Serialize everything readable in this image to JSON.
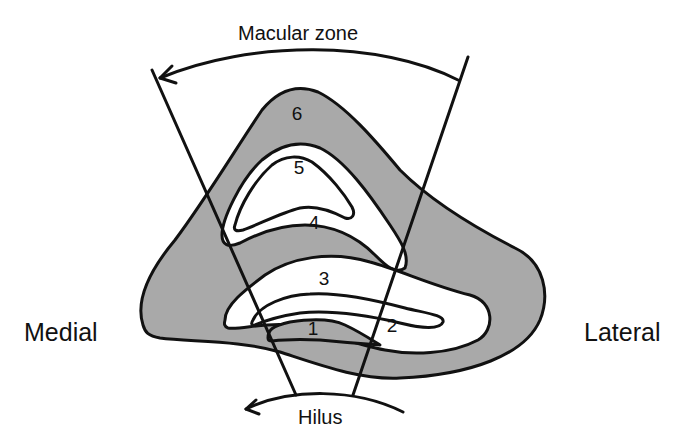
{
  "labels": {
    "top": "Macular zone",
    "bottom": "Hilus",
    "left": "Medial",
    "right": "Lateral"
  },
  "regions": [
    {
      "id": "1",
      "label": "1",
      "fill": "gray"
    },
    {
      "id": "2",
      "label": "2",
      "fill": "white"
    },
    {
      "id": "3",
      "label": "3",
      "fill": "white"
    },
    {
      "id": "4",
      "label": "4",
      "fill": "gray"
    },
    {
      "id": "5",
      "label": "5",
      "fill": "white"
    },
    {
      "id": "6",
      "label": "6",
      "fill": "gray"
    }
  ],
  "colors": {
    "gray_fill": "#a9a9a9",
    "white_fill": "#ffffff",
    "stroke": "#111111"
  }
}
